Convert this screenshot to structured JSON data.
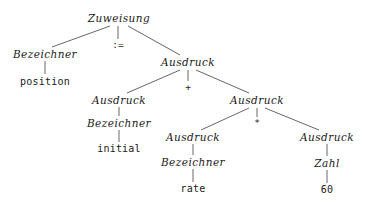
{
  "diagram": {
    "kind": "parse-tree",
    "language": "German",
    "expression": "position := initial + rate * 60",
    "width": 365,
    "height": 205,
    "background_color": "#ffffff",
    "text_color": "#1a1a1a",
    "edge_color": "#555555"
  },
  "nodes": [
    {
      "id": "n0",
      "label": "Zuweisung",
      "kind": "nonterminal",
      "x": 119,
      "y": 18
    },
    {
      "id": "n1",
      "label": "Bezeichner",
      "kind": "nonterminal",
      "x": 45,
      "y": 54
    },
    {
      "id": "n2",
      "label": ":=",
      "kind": "operator",
      "x": 118,
      "y": 45
    },
    {
      "id": "n3",
      "label": "Ausdruck",
      "kind": "nonterminal",
      "x": 188,
      "y": 62
    },
    {
      "id": "n4",
      "label": "position",
      "kind": "terminal",
      "x": 45,
      "y": 82
    },
    {
      "id": "n5",
      "label": "Ausdruck",
      "kind": "nonterminal",
      "x": 119,
      "y": 100
    },
    {
      "id": "n6",
      "label": "+",
      "kind": "operator",
      "x": 188,
      "y": 87
    },
    {
      "id": "n7",
      "label": "Ausdruck",
      "kind": "nonterminal",
      "x": 257,
      "y": 100
    },
    {
      "id": "n8",
      "label": "Bezeichner",
      "kind": "nonterminal",
      "x": 119,
      "y": 123
    },
    {
      "id": "n9",
      "label": "initial",
      "kind": "terminal",
      "x": 119,
      "y": 149
    },
    {
      "id": "n10",
      "label": "Ausdruck",
      "kind": "nonterminal",
      "x": 193,
      "y": 137
    },
    {
      "id": "n11",
      "label": "*",
      "kind": "operator",
      "x": 257,
      "y": 123
    },
    {
      "id": "n12",
      "label": "Ausdruck",
      "kind": "nonterminal",
      "x": 327,
      "y": 137
    },
    {
      "id": "n13",
      "label": "Bezeichner",
      "kind": "nonterminal",
      "x": 193,
      "y": 162
    },
    {
      "id": "n14",
      "label": "rate",
      "kind": "terminal",
      "x": 193,
      "y": 189
    },
    {
      "id": "n15",
      "label": "Zahl",
      "kind": "nonterminal",
      "x": 327,
      "y": 163
    },
    {
      "id": "n16",
      "label": "60",
      "kind": "terminal",
      "x": 327,
      "y": 190
    }
  ],
  "edges": [
    {
      "from": "n0",
      "to": "n1",
      "x1": 110,
      "y1": 26,
      "x2": 52,
      "y2": 47
    },
    {
      "from": "n0",
      "to": "n2",
      "x1": 118,
      "y1": 26,
      "x2": 118,
      "y2": 39
    },
    {
      "from": "n0",
      "to": "n3",
      "x1": 128,
      "y1": 26,
      "x2": 180,
      "y2": 55
    },
    {
      "from": "n1",
      "to": "n4",
      "x1": 45,
      "y1": 61,
      "x2": 45,
      "y2": 74
    },
    {
      "from": "n3",
      "to": "n5",
      "x1": 180,
      "y1": 70,
      "x2": 127,
      "y2": 93
    },
    {
      "from": "n3",
      "to": "n6",
      "x1": 188,
      "y1": 70,
      "x2": 188,
      "y2": 81
    },
    {
      "from": "n3",
      "to": "n7",
      "x1": 196,
      "y1": 70,
      "x2": 249,
      "y2": 93
    },
    {
      "from": "n5",
      "to": "n8",
      "x1": 119,
      "y1": 107,
      "x2": 119,
      "y2": 116
    },
    {
      "from": "n8",
      "to": "n9",
      "x1": 119,
      "y1": 130,
      "x2": 119,
      "y2": 142
    },
    {
      "from": "n7",
      "to": "n10",
      "x1": 249,
      "y1": 108,
      "x2": 201,
      "y2": 130
    },
    {
      "from": "n7",
      "to": "n11",
      "x1": 257,
      "y1": 108,
      "x2": 257,
      "y2": 117
    },
    {
      "from": "n7",
      "to": "n12",
      "x1": 265,
      "y1": 108,
      "x2": 319,
      "y2": 130
    },
    {
      "from": "n10",
      "to": "n13",
      "x1": 193,
      "y1": 144,
      "x2": 193,
      "y2": 155
    },
    {
      "from": "n13",
      "to": "n14",
      "x1": 193,
      "y1": 169,
      "x2": 193,
      "y2": 182
    },
    {
      "from": "n12",
      "to": "n15",
      "x1": 327,
      "y1": 144,
      "x2": 327,
      "y2": 156
    },
    {
      "from": "n15",
      "to": "n16",
      "x1": 327,
      "y1": 170,
      "x2": 327,
      "y2": 183
    }
  ]
}
